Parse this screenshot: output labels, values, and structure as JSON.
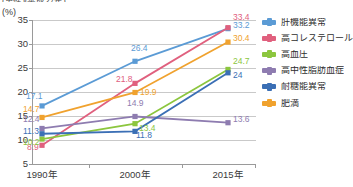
{
  "top_caption": "(男性)(平成27年)",
  "axis_unit_label": "(%)",
  "legend": {
    "items": [
      {
        "label": "肝機能異常",
        "color": "#5b9bd5",
        "icon": "line-marker-icon"
      },
      {
        "label": "高コレステロール",
        "color": "#e0607e",
        "icon": "line-marker-icon"
      },
      {
        "label": "高血圧",
        "color": "#8cc63e",
        "icon": "line-marker-icon"
      },
      {
        "label": "高中性脂肪血症",
        "color": "#8e7cb0",
        "icon": "line-marker-icon"
      },
      {
        "label": "耐糖能異常",
        "color": "#3b6fb5",
        "icon": "line-marker-icon"
      },
      {
        "label": "肥満",
        "color": "#f0a22e",
        "icon": "line-marker-icon"
      }
    ]
  },
  "chart_data": {
    "type": "line",
    "title": "",
    "xlabel": "",
    "ylabel": "(%)",
    "categories": [
      "1990年",
      "2000年",
      "2015年"
    ],
    "ylim": [
      5,
      35
    ],
    "yticks": [
      5,
      10,
      15,
      20,
      25,
      30,
      35
    ],
    "ytick_labels": [
      "5",
      "10",
      "15",
      "20",
      "25",
      "30",
      "35"
    ],
    "grid": true,
    "legend_position": "right",
    "series": [
      {
        "name": "肝機能異常",
        "color": "#5b9bd5",
        "values": [
          17.1,
          26.4,
          33.2
        ],
        "labels": [
          "17.1",
          "26.4",
          "33.2"
        ]
      },
      {
        "name": "高コレステロール",
        "color": "#e0607e",
        "values": [
          8.9,
          21.8,
          33.4
        ],
        "labels": [
          "8.9",
          "21.8",
          "33.4"
        ]
      },
      {
        "name": "高血圧",
        "color": "#8cc63e",
        "values": [
          10.2,
          13.4,
          24.7
        ],
        "labels": [
          "10.2",
          "13.4",
          "24.7"
        ]
      },
      {
        "name": "高中性脂肪血症",
        "color": "#8e7cb0",
        "values": [
          12.4,
          14.9,
          13.6
        ],
        "labels": [
          "12.4",
          "14.9",
          "13.6"
        ]
      },
      {
        "name": "耐糖能異常",
        "color": "#3b6fb5",
        "values": [
          11.3,
          11.8,
          24.0
        ],
        "labels": [
          "11.3",
          "11.8",
          "24"
        ]
      },
      {
        "name": "肥満",
        "color": "#f0a22e",
        "values": [
          14.7,
          19.9,
          30.4
        ],
        "labels": [
          "14.7",
          "19.9",
          "30.4"
        ]
      }
    ]
  }
}
